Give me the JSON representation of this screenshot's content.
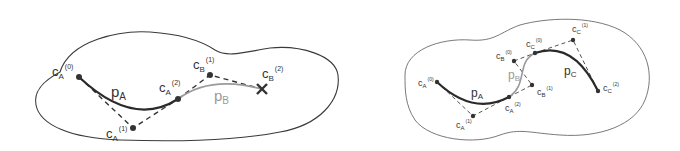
{
  "left_panel": {
    "curves": [
      {
        "name": "p",
        "sub": "A",
        "style": "dark"
      },
      {
        "name": "p",
        "sub": "B",
        "style": "gray"
      }
    ],
    "points": [
      {
        "base": "c",
        "sub": "A",
        "sup": "(0)"
      },
      {
        "base": "c",
        "sub": "A",
        "sup": "(1)"
      },
      {
        "base": "c",
        "sub": "A",
        "sup": "(2)"
      },
      {
        "base": "c",
        "sub": "B",
        "sup": "(1)"
      },
      {
        "base": "c",
        "sub": "B",
        "sup": "(2)"
      }
    ]
  },
  "right_panel": {
    "curves": [
      {
        "name": "p",
        "sub": "A",
        "style": "dark"
      },
      {
        "name": "p",
        "sub": "B",
        "style": "gray"
      },
      {
        "name": "p",
        "sub": "C",
        "style": "dark"
      }
    ],
    "points": [
      {
        "base": "c",
        "sub": "A",
        "sup": "(0)"
      },
      {
        "base": "c",
        "sub": "A",
        "sup": "(1)"
      },
      {
        "base": "c",
        "sub": "A",
        "sup": "(2)"
      },
      {
        "base": "c",
        "sub": "B",
        "sup": "(0)"
      },
      {
        "base": "c",
        "sub": "B",
        "sup": "(1)"
      },
      {
        "base": "c",
        "sub": "C",
        "sup": "(0)"
      },
      {
        "base": "c",
        "sub": "C",
        "sup": "(1)"
      },
      {
        "base": "c",
        "sub": "C",
        "sup": "(2)"
      }
    ]
  },
  "colors": {
    "dark_curve": "#2a2a2a",
    "gray_curve": "#9a9a9a",
    "outline": "#3a3a3a"
  }
}
